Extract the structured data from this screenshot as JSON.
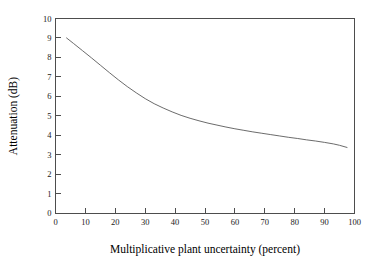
{
  "chart_data": {
    "type": "line",
    "title": "",
    "xlabel": "Multiplicative plant uncertainty (percent)",
    "ylabel": "Attenuation (dB)",
    "xlim": [
      0,
      100
    ],
    "ylim": [
      0,
      10
    ],
    "grid": false,
    "legend": null,
    "xticks": [
      0,
      10,
      20,
      30,
      40,
      50,
      60,
      70,
      80,
      90,
      100
    ],
    "xtick_labels": [
      "0",
      "10",
      "20",
      "30",
      "40",
      "50",
      "60",
      "70",
      "80",
      "90",
      "100"
    ],
    "yticks": [
      0,
      1,
      2,
      3,
      4,
      5,
      6,
      7,
      8,
      9,
      10
    ],
    "ytick_labels": [
      "0",
      "1",
      "2",
      "3",
      "4",
      "5",
      "6",
      "7",
      "8",
      "9",
      "10"
    ],
    "series": [
      {
        "name": "attenuation",
        "color": "#5a5a5a",
        "x": [
          3.7,
          6,
          9,
          12,
          15,
          18,
          21,
          24,
          27,
          30,
          33,
          36,
          39,
          42,
          45,
          48,
          51,
          54,
          57,
          60,
          63,
          66,
          69,
          72,
          75,
          78,
          81,
          84,
          87,
          90,
          93,
          95,
          97.5
        ],
        "y": [
          9.0,
          8.72,
          8.35,
          7.98,
          7.6,
          7.22,
          6.85,
          6.5,
          6.18,
          5.88,
          5.62,
          5.4,
          5.2,
          5.02,
          4.87,
          4.74,
          4.62,
          4.52,
          4.42,
          4.33,
          4.25,
          4.17,
          4.1,
          4.03,
          3.96,
          3.89,
          3.83,
          3.76,
          3.7,
          3.63,
          3.55,
          3.48,
          3.37
        ]
      }
    ]
  },
  "axes": {
    "x_title": "Multiplicative plant uncertainty (percent)",
    "y_title": "Attenuation (dB)"
  }
}
